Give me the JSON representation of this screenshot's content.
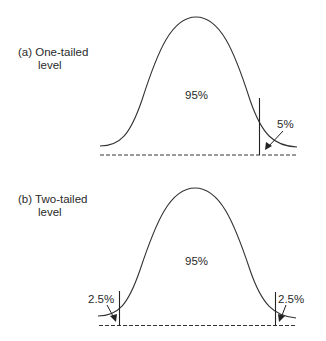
{
  "panels": [
    {
      "id": "a",
      "label_line1": "(a) One-tailed",
      "label_line2": "level",
      "center_label": "95%",
      "tail_labels": {
        "right": "5%"
      }
    },
    {
      "id": "b",
      "label_line1": "(b) Two-tailed",
      "label_line2": "level",
      "center_label": "95%",
      "tail_labels": {
        "left": "2.5%",
        "right": "2.5%"
      }
    }
  ],
  "colors": {
    "stroke": "#333333",
    "background": "#ffffff"
  }
}
